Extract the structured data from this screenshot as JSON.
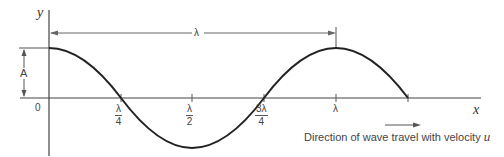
{
  "diagram": {
    "axes": {
      "y_label": "y",
      "x_label": "x",
      "origin_label": "0"
    },
    "amplitude_label": "A",
    "wavelength_label": "λ",
    "ticks": [
      {
        "num": "λ",
        "den": "4"
      },
      {
        "num": "λ",
        "den": "2"
      },
      {
        "num": "3λ",
        "den": "4"
      },
      {
        "label": "λ"
      }
    ],
    "caption": {
      "text": "Direction of wave travel with velocity",
      "variable": "u"
    },
    "colors": {
      "curve": "#222222",
      "axis": "#444444",
      "annotation": "#555555"
    }
  }
}
